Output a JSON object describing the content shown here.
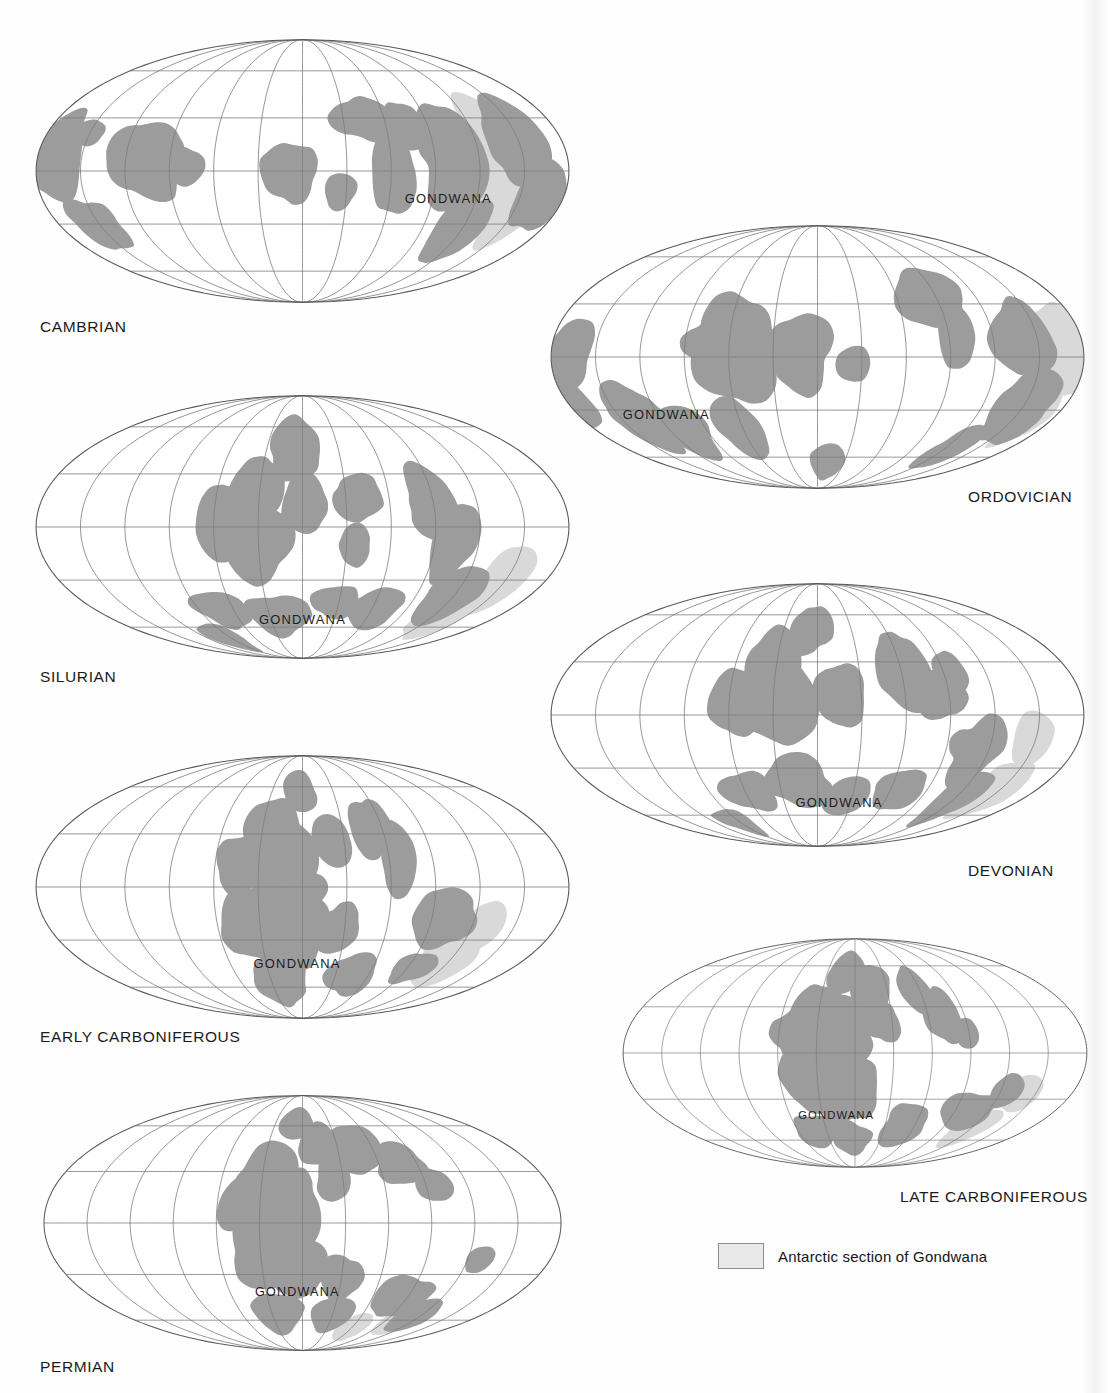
{
  "figure": {
    "type": "paleogeographic-map-series",
    "projection": "Mollweide (oval equal-area)",
    "graticule": {
      "meridian_interval_deg": 30,
      "parallel_interval_deg": 30
    },
    "colors": {
      "background": "#ffffff",
      "land": "#9c9c9c",
      "antarctic_section": "#d9d9d9",
      "graticule": "#7d7d7d",
      "outline": "#5a5a5a",
      "text": "#1b1b1b"
    }
  },
  "legend": {
    "swatch_color": "#e9e9e9",
    "label": "Antarctic section of Gondwana"
  },
  "maps": [
    {
      "id": "cambrian",
      "era_label": "CAMBRIAN",
      "gondwana_label": "GONDWANA",
      "label_align": "left",
      "panel": {
        "x": 30,
        "y": 36,
        "w": 545,
        "h": 270
      },
      "era_label_pos": {
        "x": 40,
        "y": 318
      },
      "gondwana_pos_pct": {
        "x": 77,
        "y": 62
      }
    },
    {
      "id": "ordovician",
      "era_label": "ORDOVICIAN",
      "gondwana_label": "GONDWANA",
      "label_align": "right",
      "panel": {
        "x": 545,
        "y": 222,
        "w": 545,
        "h": 270
      },
      "era_label_pos": {
        "x": 968,
        "y": 488
      },
      "gondwana_pos_pct": {
        "x": 22,
        "y": 73
      }
    },
    {
      "id": "silurian",
      "era_label": "SILURIAN",
      "gondwana_label": "GONDWANA",
      "label_align": "left",
      "panel": {
        "x": 30,
        "y": 392,
        "w": 545,
        "h": 270
      },
      "era_label_pos": {
        "x": 40,
        "y": 668
      },
      "gondwana_pos_pct": {
        "x": 50,
        "y": 86
      }
    },
    {
      "id": "devonian",
      "era_label": "DEVONIAN",
      "gondwana_label": "GONDWANA",
      "label_align": "right",
      "panel": {
        "x": 545,
        "y": 580,
        "w": 545,
        "h": 270
      },
      "era_label_pos": {
        "x": 968,
        "y": 862
      },
      "gondwana_pos_pct": {
        "x": 54,
        "y": 84
      }
    },
    {
      "id": "early-carboniferous",
      "era_label": "EARLY CARBONIFEROUS",
      "gondwana_label": "GONDWANA",
      "label_align": "left",
      "panel": {
        "x": 30,
        "y": 752,
        "w": 545,
        "h": 270
      },
      "era_label_pos": {
        "x": 40,
        "y": 1028
      },
      "gondwana_pos_pct": {
        "x": 49,
        "y": 80
      }
    },
    {
      "id": "late-carboniferous",
      "era_label": "LATE CARBONIFEROUS",
      "gondwana_label": "GONDWANA",
      "label_align": "right",
      "panel": {
        "x": 620,
        "y": 928,
        "w": 470,
        "h": 250
      },
      "era_label_pos": {
        "x": 900,
        "y": 1188
      },
      "gondwana_pos_pct": {
        "x": 46,
        "y": 78
      }
    },
    {
      "id": "permian",
      "era_label": "PERMIAN",
      "gondwana_label": "GONDWANA",
      "label_align": "left",
      "panel": {
        "x": 30,
        "y": 1092,
        "w": 545,
        "h": 262
      },
      "era_label_pos": {
        "x": 40,
        "y": 1358
      },
      "gondwana_pos_pct": {
        "x": 49,
        "y": 78
      }
    }
  ],
  "landmasses": {
    "cambrian": [
      "M6,44 L14,38 L26,37 L36,41 L44,48 L46,56 L44,64 L40,72 L36,80 L30,84 L22,82 L14,76 L8,66 L5,54 Z",
      "M22,31 L32,27 L41,28 L44,32 L38,35 L30,36 L24,34 Z",
      "M16,72 L26,68 L36,70 L42,76 L44,84 L40,90 L32,92 L24,88 L18,81 Z",
      "M63,37 L76,33 L88,34 L97,39 L104,46 L108,54 L106,62 L99,68 L88,71 L76,70 L66,65 L60,57 L58,47 Z",
      "M90,44 L104,42 L116,45 L121,52 L118,60 L108,63 L96,61 L89,54 Z",
      "M143,46 L157,43 L168,46 L174,53 L172,61 L164,66 L152,66 L143,61 L139,53 Z",
      "M186,48 L196,46 L203,50 L205,57 L200,62 L191,62 L185,57 Z",
      "M176,28 L189,22 L202,22 L211,27 L214,34 L208,40 L196,42 L184,39 L177,34 Z",
      "M201,33 L212,30 L220,33 L221,39 L214,43 L204,42 Z",
      "M213,36 L226,31 L238,32 L244,38 L241,46 L231,50 L219,48 L212,43 Z",
      "M221,44 L232,42 L241,46 L243,54 L238,60 L228,61 L220,55 Z",
      "M233,28 L246,24 L257,26 L261,33 L255,39 L243,40 L234,35 Z",
      "M243,48 L256,45 L266,49 L270,57 L266,65 L256,68 L245,65 L240,57 Z",
      "M246,58 L260,56 L270,61 L272,70 L266,78 L254,80 L245,74 L241,66 Z",
      "M238,66 L252,68 L262,75 L264,84 L256,90 L244,89 L236,82 L234,73 Z",
      "M252,72 L266,74 L274,82 L272,90 L262,94 L251,91 L246,83 Z"
    ],
    "antarctic": [
      "M262,28 L276,24 L288,27 L294,35 L292,45 L284,52 L272,53 L263,47 L259,37 Z",
      "M268,46 L282,48 L291,56 L290,66 L282,72 L270,71 L263,63 L263,53 Z",
      "M259,62 L272,64 L281,72 L280,82 L271,88 L260,86 L254,77 L254,68 Z"
    ]
  },
  "chart_data": {
    "type": "map",
    "panels": [
      "CAMBRIAN",
      "ORDOVICIAN",
      "SILURIAN",
      "DEVONIAN",
      "EARLY CARBONIFEROUS",
      "LATE CARBONIFEROUS",
      "PERMIAN"
    ],
    "annotations": [
      "GONDWANA"
    ],
    "legend_entries": [
      "Antarctic section of Gondwana"
    ]
  }
}
